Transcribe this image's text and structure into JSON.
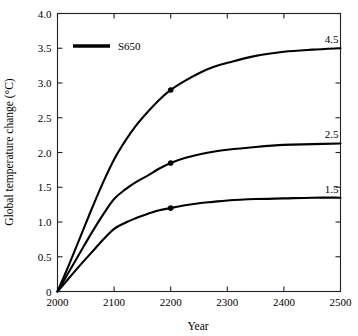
{
  "chart_data": {
    "type": "line",
    "title": "",
    "xlabel": "Year",
    "ylabel": "Global temperature change (°C)",
    "xlim": [
      2000,
      2500
    ],
    "ylim": [
      0,
      4.0
    ],
    "grid": false,
    "legend_position": "top-left",
    "legend": [
      {
        "label": "S650",
        "color": "#000000"
      }
    ],
    "xticks": [
      2000,
      2100,
      2200,
      2300,
      2400,
      2500
    ],
    "xtick_labels": [
      "2000",
      "2100",
      "2200",
      "2300",
      "2400",
      "2500"
    ],
    "yticks": [
      0,
      0.5,
      1.0,
      1.5,
      2.0,
      2.5,
      3.0,
      3.5,
      4.0
    ],
    "ytick_labels": [
      "0",
      "0.5",
      "1.0",
      "1.5",
      "2.0",
      "2.5",
      "3.0",
      "3.5",
      "4.0"
    ],
    "series": [
      {
        "name": "4.5",
        "end_label": "4.5",
        "color": "#000000",
        "x": [
          2000,
          2020,
          2040,
          2060,
          2080,
          2100,
          2120,
          2140,
          2160,
          2180,
          2200,
          2225,
          2250,
          2275,
          2300,
          2350,
          2400,
          2450,
          2500
        ],
        "values": [
          0.0,
          0.38,
          0.78,
          1.18,
          1.56,
          1.9,
          2.17,
          2.4,
          2.59,
          2.76,
          2.9,
          3.03,
          3.14,
          3.23,
          3.29,
          3.39,
          3.45,
          3.48,
          3.5
        ],
        "marker_points": [
          {
            "x": 2200,
            "y": 2.9
          }
        ]
      },
      {
        "name": "2.5",
        "end_label": "2.5",
        "color": "#000000",
        "x": [
          2000,
          2020,
          2040,
          2060,
          2080,
          2100,
          2120,
          2140,
          2160,
          2180,
          2200,
          2225,
          2250,
          2275,
          2300,
          2350,
          2400,
          2450,
          2500
        ],
        "values": [
          0.0,
          0.28,
          0.56,
          0.84,
          1.1,
          1.33,
          1.47,
          1.58,
          1.67,
          1.77,
          1.85,
          1.92,
          1.97,
          2.01,
          2.04,
          2.08,
          2.11,
          2.12,
          2.13
        ],
        "marker_points": [
          {
            "x": 2200,
            "y": 1.85
          }
        ]
      },
      {
        "name": "1.5",
        "end_label": "1.5",
        "color": "#000000",
        "x": [
          2000,
          2020,
          2040,
          2060,
          2080,
          2100,
          2120,
          2140,
          2160,
          2180,
          2200,
          2225,
          2250,
          2275,
          2300,
          2350,
          2400,
          2450,
          2500
        ],
        "values": [
          0.0,
          0.19,
          0.38,
          0.56,
          0.74,
          0.9,
          0.99,
          1.06,
          1.12,
          1.17,
          1.2,
          1.24,
          1.27,
          1.29,
          1.31,
          1.33,
          1.34,
          1.35,
          1.35
        ],
        "marker_points": [
          {
            "x": 2200,
            "y": 1.2
          }
        ]
      }
    ]
  }
}
